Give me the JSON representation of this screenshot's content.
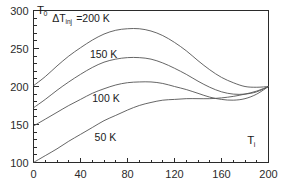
{
  "chart_data": {
    "type": "line",
    "title": "",
    "xlabel": "T_i",
    "ylabel": "T_0",
    "xlim": [
      0,
      200
    ],
    "ylim": [
      100,
      300
    ],
    "x_ticks_major": [
      0,
      40,
      80,
      120,
      160,
      200
    ],
    "x_ticks_major_labels": [
      "0",
      "40",
      "80",
      "120",
      "160",
      "200"
    ],
    "x_minor_tick_step": 10,
    "y_ticks_major": [
      100,
      150,
      200,
      250,
      300
    ],
    "y_ticks_major_labels": [
      "100",
      "150",
      "200",
      "250",
      "300"
    ],
    "y_minor_tick_step": 10,
    "grid": false,
    "legend_position": "inline-annotations",
    "annotations": [
      {
        "text": "T",
        "sub": "0",
        "x": 3,
        "y": 296,
        "name": "y-axis-symbol"
      },
      {
        "text": "T",
        "sub": "i",
        "x": 182,
        "y": 124,
        "name": "x-axis-symbol"
      }
    ],
    "series": [
      {
        "name": "dT200",
        "label_prefix": "ΔT",
        "label_sub": "inj",
        "label_suffix": "=200 K",
        "label_x": 16,
        "label_y": 285,
        "delta_t": 200,
        "color": "#555555",
        "x": [
          0,
          10,
          20,
          30,
          40,
          50,
          60,
          70,
          80,
          90,
          100,
          110,
          120,
          130,
          140,
          150,
          160,
          170,
          180,
          190,
          200
        ],
        "y": [
          201,
          213,
          227,
          240,
          251,
          261,
          269,
          274,
          276,
          276,
          273,
          267,
          258,
          247,
          234,
          222,
          212,
          205,
          200,
          199,
          200
        ]
      },
      {
        "name": "dT150",
        "label_prefix": "",
        "label_sub": "",
        "label_suffix": "150 K",
        "label_x": 48,
        "label_y": 237,
        "delta_t": 150,
        "color": "#555555",
        "x": [
          0,
          10,
          20,
          30,
          40,
          50,
          60,
          70,
          80,
          90,
          100,
          110,
          120,
          130,
          140,
          150,
          160,
          170,
          180,
          190,
          200
        ],
        "y": [
          172,
          183,
          195,
          206,
          216,
          225,
          232,
          236,
          238,
          238,
          236,
          231,
          224,
          216,
          207,
          199,
          193,
          190,
          190,
          193,
          200
        ]
      },
      {
        "name": "dT100",
        "label_prefix": "",
        "label_sub": "",
        "label_suffix": "100 K",
        "label_x": 50,
        "label_y": 179,
        "delta_t": 100,
        "color": "#555555",
        "x": [
          0,
          10,
          20,
          30,
          40,
          50,
          60,
          70,
          80,
          90,
          100,
          110,
          120,
          130,
          140,
          150,
          160,
          170,
          180,
          190,
          200
        ],
        "y": [
          148,
          157,
          166,
          175,
          183,
          191,
          197,
          202,
          205,
          206,
          206,
          204,
          200,
          196,
          191,
          186,
          183,
          182,
          184,
          190,
          200
        ]
      },
      {
        "name": "dT50",
        "label_prefix": "",
        "label_sub": "",
        "label_suffix": "50 K",
        "label_x": 52,
        "label_y": 128,
        "delta_t": 50,
        "color": "#3a3a3a",
        "x": [
          0,
          10,
          20,
          30,
          40,
          50,
          60,
          70,
          80,
          90,
          100,
          110,
          120,
          130,
          140,
          150,
          160,
          170,
          180,
          190,
          200
        ],
        "y": [
          100,
          109,
          118,
          128,
          137,
          146,
          155,
          162,
          169,
          175,
          179,
          182,
          183,
          184,
          184,
          184,
          185,
          187,
          190,
          194,
          200
        ]
      }
    ]
  }
}
